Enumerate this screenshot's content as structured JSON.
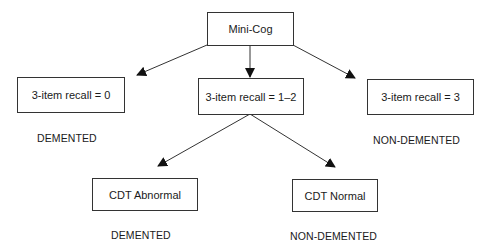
{
  "diagram": {
    "root": {
      "label": "Mini-Cog"
    },
    "recall_nodes": [
      {
        "label": "3-item recall = 0",
        "outcome": "DEMENTED"
      },
      {
        "label": "3-item recall = 1–2",
        "outcome": ""
      },
      {
        "label": "3-item recall = 3",
        "outcome": "NON-DEMENTED"
      }
    ],
    "cdt_nodes": [
      {
        "label": "CDT Abnormal",
        "outcome": "DEMENTED"
      },
      {
        "label": "CDT Normal",
        "outcome": "NON-DEMENTED"
      }
    ],
    "colors": {
      "line": "#333333",
      "text": "#1a1a1a",
      "background": "#ffffff"
    }
  }
}
